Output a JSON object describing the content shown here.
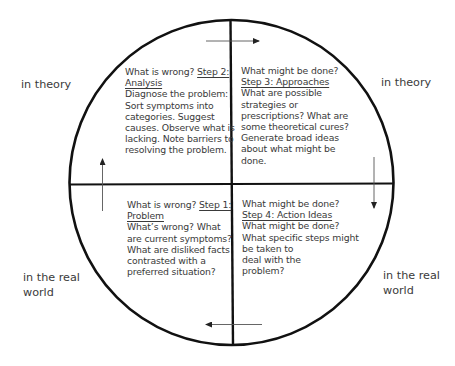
{
  "diagram": {
    "type": "four-quadrant circle",
    "colors": {
      "outline": "#111111",
      "text": "#3a3a3a",
      "arrow": "#555555"
    },
    "side_labels": {
      "top_left": [
        "in theory"
      ],
      "top_right": [
        "in theory"
      ],
      "bottom_left": [
        "in the real",
        "world"
      ],
      "bottom_right": [
        "in the real",
        "world"
      ]
    },
    "quadrants": {
      "top_left": {
        "question": "What is wrong? ",
        "step_title": "Step 2:",
        "step_title_cont": "Analysis",
        "body": [
          "Diagnose the problem:",
          "Sort symptoms into",
          "categories. Suggest",
          "causes. Observe what is",
          "lacking. Note barriers to",
          "resolving the problem."
        ]
      },
      "top_right": {
        "question": "What might be done?",
        "step_title": "Step 3: Approaches",
        "body": [
          "What are possible",
          "strategies or",
          "prescriptions? What are",
          "some theoretical cures?",
          "Generate broad ideas",
          "about what might be",
          "done."
        ]
      },
      "bottom_left": {
        "question": "What is wrong? ",
        "step_title": "Step 1:",
        "step_title_cont": "Problem",
        "body": [
          "What’s wrong? What",
          "are current symptoms?",
          "What are disliked facts",
          "contrasted with a",
          "preferred situation?"
        ]
      },
      "bottom_right": {
        "question": "What might be done?",
        "step_title": "Step 4: Action Ideas",
        "body": [
          "What might be done?",
          "What specific steps might",
          "be taken to",
          "deal with the",
          "problem?"
        ]
      }
    },
    "arrows": [
      {
        "position": "top",
        "direction": "right"
      },
      {
        "position": "right",
        "direction": "down"
      },
      {
        "position": "bottom",
        "direction": "left"
      },
      {
        "position": "left",
        "direction": "up"
      }
    ]
  }
}
